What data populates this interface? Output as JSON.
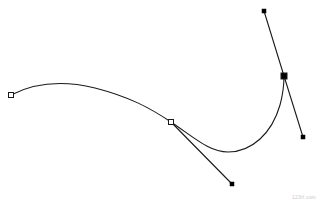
{
  "document": {
    "title": "Bezier Curve Path",
    "canvas": {
      "width": 318,
      "height": 202,
      "background": "#ffffff"
    }
  },
  "style": {
    "curve_stroke": "#1a1a1a",
    "curve_width": 1.1,
    "handle_stroke": "#1a1a1a",
    "handle_width": 1.1,
    "anchor_fill_open": "#ffffff",
    "anchor_stroke": "#1a1a1a",
    "anchor_fill_selected": "#000000",
    "handle_point_fill": "#000000"
  },
  "watermark": {
    "text": "123rf.com"
  },
  "chart_data": {
    "type": "line",
    "xlabel": "",
    "ylabel": "",
    "xlim": [
      0,
      318
    ],
    "ylim": [
      0,
      202
    ],
    "grid": false,
    "legend": "none",
    "path_d": "M 11 95 C 40 80, 70 82, 95 88 C 130 97, 150 108, 171 122 C 196 139, 210 152, 228 152 C 252 152, 272 133, 280 105 C 283 94, 284 84, 284 76",
    "handles": [
      {
        "name": "handle-line-middle-anchor",
        "from": [
          171,
          122
        ],
        "to": [
          232,
          184
        ]
      },
      {
        "name": "handle-line-right-anchor-upper",
        "from": [
          264,
          11
        ],
        "to": [
          284,
          76
        ]
      },
      {
        "name": "handle-line-right-anchor-lower",
        "from": [
          284,
          76
        ],
        "to": [
          303,
          137
        ]
      }
    ],
    "anchors": [
      {
        "name": "anchor-start",
        "x": 11,
        "y": 95,
        "kind": "open",
        "size": 5
      },
      {
        "name": "anchor-middle",
        "x": 171,
        "y": 122,
        "kind": "open",
        "size": 5
      },
      {
        "name": "anchor-end",
        "x": 284,
        "y": 76,
        "kind": "selected",
        "size": 6
      }
    ],
    "control_points": [
      {
        "name": "control-point-middle-out",
        "x": 232,
        "y": 184,
        "size": 4
      },
      {
        "name": "control-point-end-in",
        "x": 264,
        "y": 11,
        "size": 4
      },
      {
        "name": "control-point-end-out",
        "x": 303,
        "y": 137,
        "size": 4
      }
    ]
  }
}
